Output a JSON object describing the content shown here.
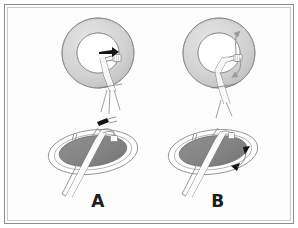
{
  "figure": {
    "caption_visible": false,
    "background_color": "#ffffff",
    "frame_color": "#8d8d8d",
    "panels": [
      {
        "id": "A",
        "label": "A",
        "views": [
          {
            "name": "annulus-top-view",
            "shape": "ring",
            "ring_outer_color": "#d8d8d8",
            "ring_inner_color": "#ffffff",
            "ring_outline_color": "#8a8a8a",
            "annotations": [
              {
                "type": "arrowhead",
                "direction": "right",
                "color": "#111111"
              },
              {
                "type": "suture-needle",
                "color": "#ffffff",
                "outline": "#7d7d7d"
              }
            ]
          },
          {
            "name": "annulus-oblique-view",
            "shape": "ellipse",
            "ellipse_fill_color": "#848484",
            "ellipse_rim_color": "#ffffff",
            "ellipse_outline_color": "#8a8a8a",
            "annotations": [
              {
                "type": "clip",
                "color": "#1a1a1a"
              },
              {
                "type": "forceps",
                "color": "#ffffff",
                "outline": "#7d7d7d"
              }
            ]
          }
        ]
      },
      {
        "id": "B",
        "label": "B",
        "views": [
          {
            "name": "annulus-top-view",
            "shape": "ring",
            "ring_outer_color": "#d8d8d8",
            "ring_inner_color": "#ffffff",
            "ring_outline_color": "#8a8a8a",
            "annotations": [
              {
                "type": "curved-arrow",
                "direction": "counterclockwise-up",
                "color": "#9a9a9a"
              },
              {
                "type": "curved-arrow",
                "direction": "clockwise-down",
                "color": "#9a9a9a"
              },
              {
                "type": "suture-needle",
                "color": "#ffffff",
                "outline": "#7d7d7d"
              }
            ]
          },
          {
            "name": "annulus-oblique-view",
            "shape": "ellipse",
            "ellipse_fill_color": "#848484",
            "ellipse_rim_color": "#ffffff",
            "ellipse_outline_color": "#8a8a8a",
            "annotations": [
              {
                "type": "arrowhead",
                "direction": "down",
                "color": "#111111"
              },
              {
                "type": "arrowhead",
                "direction": "left-down",
                "color": "#111111"
              },
              {
                "type": "forceps",
                "color": "#ffffff",
                "outline": "#7d7d7d"
              }
            ]
          }
        ]
      }
    ]
  }
}
